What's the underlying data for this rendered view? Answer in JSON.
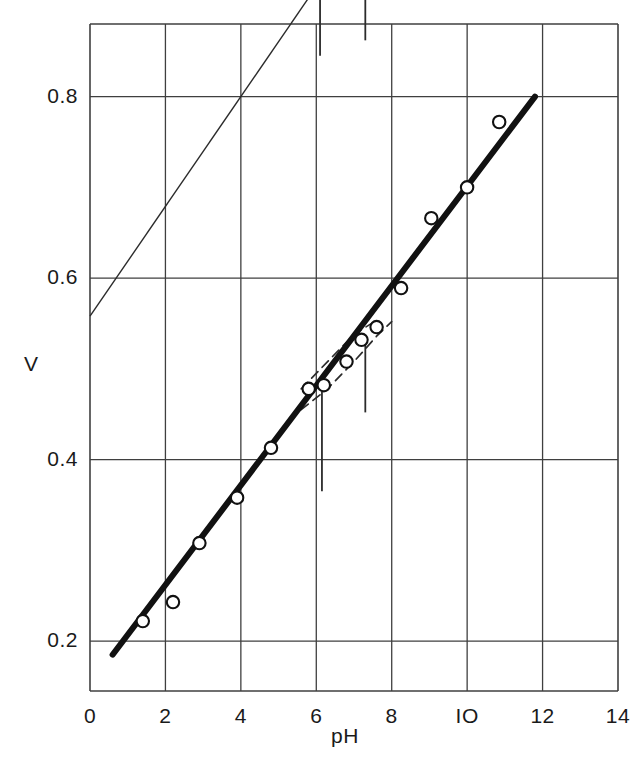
{
  "chart_data": {
    "type": "scatter",
    "title": "",
    "subtitle": "",
    "xlabel": "pH",
    "ylabel": "V",
    "xlim": [
      0,
      14
    ],
    "ylim": [
      0.88,
      0.145
    ],
    "y_axis_inverted": true,
    "grid": true,
    "legend_position": "none",
    "x_ticks": [
      0,
      2,
      4,
      6,
      8,
      10,
      12,
      14
    ],
    "x_tick_labels": [
      "0",
      "2",
      "4",
      "6",
      "8",
      "IO",
      "12",
      "14"
    ],
    "y_ticks": [
      0.2,
      0.4,
      0.6,
      0.8
    ],
    "y_tick_labels": [
      "0.2",
      "0.4",
      "0.6",
      "0.8"
    ],
    "series": [
      {
        "name": "measured-points",
        "marker": "open-circle",
        "x": [
          1.4,
          2.2,
          2.9,
          3.9,
          4.8,
          5.8,
          6.2,
          6.8,
          7.2,
          7.6,
          8.25,
          9.05,
          10.0,
          10.85
        ],
        "y": [
          0.222,
          0.243,
          0.308,
          0.358,
          0.413,
          0.478,
          0.482,
          0.508,
          0.532,
          0.546,
          0.589,
          0.666,
          0.7,
          0.772
        ]
      },
      {
        "name": "fitted-line-thick",
        "marker": "none",
        "style": "solid-thick",
        "x": [
          0.6,
          11.8
        ],
        "y": [
          0.185,
          0.8
        ]
      },
      {
        "name": "reference-line-thin",
        "marker": "none",
        "style": "solid-thin",
        "x": [
          0.0,
          5.85
        ],
        "y": [
          0.558,
          0.912
        ]
      },
      {
        "name": "dashed-envelope-upper",
        "marker": "none",
        "style": "dashed",
        "x": [
          5.6,
          6.3,
          7.0,
          7.6,
          8.0
        ],
        "y": [
          0.455,
          0.478,
          0.508,
          0.536,
          0.552
        ]
      },
      {
        "name": "dashed-envelope-lower",
        "marker": "none",
        "style": "dashed",
        "x": [
          5.6,
          6.3,
          7.0,
          7.5
        ],
        "y": [
          0.478,
          0.508,
          0.538,
          0.551
        ]
      }
    ],
    "annotations": [
      {
        "name": "marker-line-inner-a",
        "type": "vertical-bar",
        "x": 6.15,
        "y_top": 0.365,
        "y_bottom": 0.475
      },
      {
        "name": "marker-line-inner-b",
        "type": "vertical-bar",
        "x": 7.3,
        "y_top": 0.452,
        "y_bottom": 0.53
      },
      {
        "name": "marker-line-axis-a",
        "type": "vertical-bar",
        "x": 6.1,
        "y_top": 0.845,
        "y_bottom": 0.912
      },
      {
        "name": "marker-line-axis-b",
        "type": "vertical-bar",
        "x": 7.3,
        "y_top": 0.862,
        "y_bottom": 0.912
      }
    ],
    "colors": {
      "ink": "#1a1a1a",
      "grid": "#4a4a4a",
      "background": "#ffffff"
    }
  },
  "axis": {
    "y_title": "V",
    "x_title": "pH"
  }
}
